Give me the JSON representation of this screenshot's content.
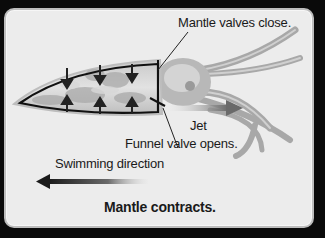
{
  "diagram": {
    "title": "Mantle contracts.",
    "labels": {
      "mantle_valves": "Mantle valves close.",
      "jet": "Jet",
      "funnel_valve": "Funnel valve opens.",
      "swimming_direction": "Swimming direction"
    },
    "colors": {
      "background": "#0a0a0a",
      "panel": "#ececec",
      "outline": "#111111",
      "jet_arrow": "#6a6a6a"
    }
  }
}
